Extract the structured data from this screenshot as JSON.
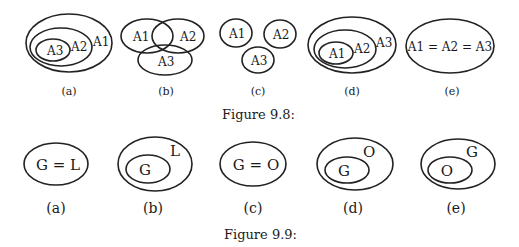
{
  "figure_9_8": {
    "caption": "Figure 9.8:",
    "panels": [
      {
        "id": "a",
        "label": "(a)",
        "sets": [
          "A3",
          "A2",
          "A1"
        ],
        "relation": "A3 ⊂ A2 ⊂ A1"
      },
      {
        "id": "b",
        "label": "(b)",
        "sets": [
          "A1",
          "A2",
          "A3"
        ],
        "relation": "overlapping"
      },
      {
        "id": "c",
        "label": "(c)",
        "sets": [
          "A1",
          "A2",
          "A3"
        ],
        "relation": "disjoint"
      },
      {
        "id": "d",
        "label": "(d)",
        "sets": [
          "A1",
          "A2",
          "A3"
        ],
        "relation": "A1 ⊂ A2 ⊂ A3"
      },
      {
        "id": "e",
        "label": "(e)",
        "text": "A1 = A2 = A3",
        "relation": "equal"
      }
    ]
  },
  "figure_9_9": {
    "caption": "Figure 9.9:",
    "panels": [
      {
        "id": "a",
        "label": "(a)",
        "text": "G = L"
      },
      {
        "id": "b",
        "label": "(b)",
        "inner": "G",
        "outer": "L"
      },
      {
        "id": "c",
        "label": "(c)",
        "text": "G = O"
      },
      {
        "id": "d",
        "label": "(d)",
        "inner": "G",
        "outer": "O"
      },
      {
        "id": "e",
        "label": "(e)",
        "inner": "O",
        "outer": "G"
      }
    ]
  }
}
